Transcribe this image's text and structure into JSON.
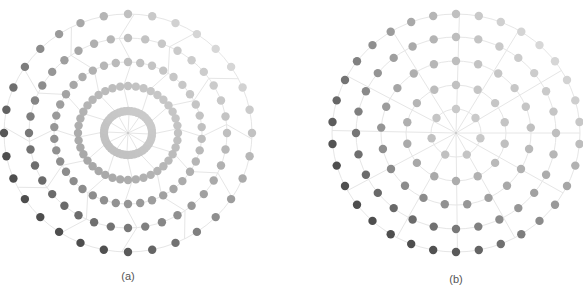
{
  "figure": {
    "panels": [
      {
        "id": "a",
        "caption": "(a)",
        "center": [
          128,
          133
        ],
        "caption_pos": [
          128,
          270
        ],
        "spoke_count": 12,
        "spoke_style": "kinked",
        "rings": [
          {
            "rx": 24,
            "ry": 22,
            "dots": 48,
            "dot_r": 4.2
          },
          {
            "rx": 50,
            "ry": 47,
            "dots": 40,
            "dot_r": 4.2
          },
          {
            "rx": 74,
            "ry": 71,
            "dots": 38,
            "dot_r": 4.2
          },
          {
            "rx": 99,
            "ry": 95,
            "dots": 36,
            "dot_r": 4.2
          },
          {
            "rx": 124,
            "ry": 119,
            "dots": 32,
            "dot_r": 4.2
          }
        ]
      },
      {
        "id": "b",
        "caption": "(b)",
        "center": [
          456,
          133
        ],
        "caption_pos": [
          456,
          273
        ],
        "spoke_count": 12,
        "spoke_style": "straight",
        "rings": [
          {
            "rx": 25,
            "ry": 24,
            "dots": 7,
            "dot_r": 4.2
          },
          {
            "rx": 50,
            "ry": 48,
            "dots": 14,
            "dot_r": 4.2
          },
          {
            "rx": 75,
            "ry": 72,
            "dots": 21,
            "dot_r": 4.2
          },
          {
            "rx": 100,
            "ry": 96,
            "dots": 28,
            "dot_r": 4.2
          },
          {
            "rx": 124,
            "ry": 119,
            "dots": 34,
            "dot_r": 4.2
          }
        ]
      }
    ],
    "colors": {
      "background": "#ffffff",
      "grid_line": "#e6e6e6",
      "dot_lightest": "#ebebeb",
      "dot_darkest": "#4e4e4e",
      "caption": "#555555"
    }
  }
}
